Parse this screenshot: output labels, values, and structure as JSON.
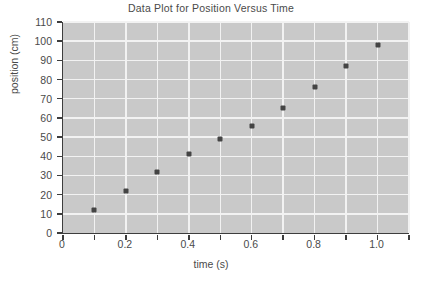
{
  "chart_data": {
    "type": "scatter",
    "title": "Data Plot for Position Versus Time",
    "xlabel": "time (s)",
    "ylabel": "position (cm)",
    "x": [
      0.1,
      0.2,
      0.3,
      0.4,
      0.5,
      0.6,
      0.7,
      0.8,
      0.9,
      1.0
    ],
    "values": [
      12,
      22,
      32,
      41,
      49,
      56,
      65,
      76,
      87,
      98
    ],
    "series": [
      {
        "name": "position",
        "points": [
          {
            "x": 0.1,
            "y": 12
          },
          {
            "x": 0.2,
            "y": 22
          },
          {
            "x": 0.3,
            "y": 32
          },
          {
            "x": 0.4,
            "y": 41
          },
          {
            "x": 0.5,
            "y": 49
          },
          {
            "x": 0.6,
            "y": 56
          },
          {
            "x": 0.7,
            "y": 65
          },
          {
            "x": 0.8,
            "y": 76
          },
          {
            "x": 0.9,
            "y": 87
          },
          {
            "x": 1.0,
            "y": 98
          }
        ]
      }
    ],
    "xlim": [
      0,
      1.1
    ],
    "ylim": [
      0,
      110
    ],
    "xtick_values": [
      0,
      0.1,
      0.2,
      0.3,
      0.4,
      0.5,
      0.6,
      0.7,
      0.8,
      0.9,
      1.0,
      1.1
    ],
    "xtick_labels_shown": [
      "0",
      "0.2",
      "0.4",
      "0.6",
      "0.8",
      "1.0"
    ],
    "xtick_labels_shown_values": [
      0,
      0.2,
      0.4,
      0.6,
      0.8,
      1.0
    ],
    "ytick_values": [
      0,
      10,
      20,
      30,
      40,
      50,
      60,
      70,
      80,
      90,
      100,
      110
    ],
    "ytick_labels": [
      "0",
      "10",
      "20",
      "30",
      "40",
      "50",
      "60",
      "70",
      "80",
      "90",
      "100",
      "110"
    ],
    "grid": true,
    "grid_color": "#f2f2f2",
    "plot_background": "#c9c9c9",
    "axis_color": "#3d3d3d",
    "marker_color": "#444444",
    "text_color": "#4a4a4a",
    "legend": null
  }
}
